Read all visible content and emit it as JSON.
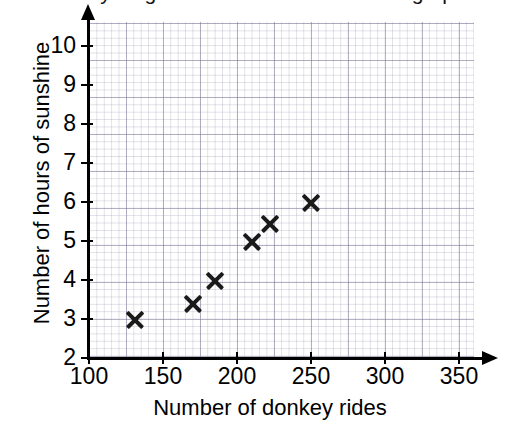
{
  "title": {
    "text": "Key stage 3 mathematics — scatter graph",
    "clipped": true
  },
  "chart_data": {
    "type": "scatter",
    "title": "",
    "xlabel": "Number of donkey rides",
    "ylabel": "Number of hours of sunshine",
    "xlim": [
      100,
      360
    ],
    "ylim": [
      2,
      10.6
    ],
    "xticks": [
      100,
      150,
      200,
      250,
      300,
      350
    ],
    "yticks": [
      2,
      3,
      4,
      5,
      6,
      7,
      8,
      9,
      10
    ],
    "grid": true,
    "grid_style": "graph-paper minor and major squares",
    "legend": "none",
    "marker": "x",
    "marker_color": "#1a1a1a",
    "points": [
      {
        "x": 131,
        "y": 3
      },
      {
        "x": 170,
        "y": 3.4
      },
      {
        "x": 185,
        "y": 4
      },
      {
        "x": 210,
        "y": 5
      },
      {
        "x": 222,
        "y": 5.45
      },
      {
        "x": 250,
        "y": 6
      }
    ]
  },
  "axes": {
    "x_tick_labels": [
      "100",
      "150",
      "200",
      "250",
      "300",
      "350"
    ],
    "y_tick_labels": [
      "2",
      "3",
      "4",
      "5",
      "6",
      "7",
      "8",
      "9",
      "10"
    ],
    "x_title": "Number of donkey rides",
    "y_title": "Number of hours of sunshine",
    "axis_color": "#000000"
  }
}
